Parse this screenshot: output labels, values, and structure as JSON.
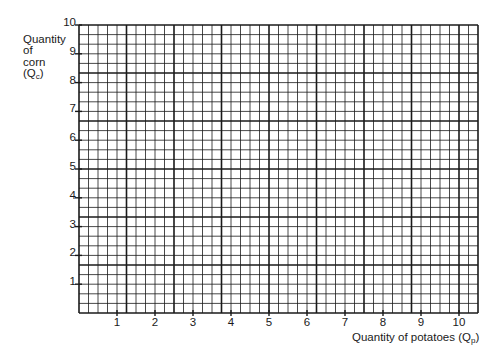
{
  "chart_data": {
    "type": "line",
    "title": "",
    "xlabel": "Quantity of potatoes",
    "xlabel_sub": "p",
    "ylabel_lines": [
      "Quantity",
      "of",
      "corn"
    ],
    "ylabel_symbol": "Q",
    "ylabel_sub": "c",
    "xlim": [
      0,
      10.5
    ],
    "ylim": [
      0,
      10
    ],
    "x_ticks": [
      1,
      2,
      3,
      4,
      5,
      6,
      7,
      8,
      9,
      10
    ],
    "y_ticks": [
      1,
      2,
      3,
      4,
      5,
      6,
      7,
      8,
      9,
      10
    ],
    "x_tick_labels": [
      "1",
      "2",
      "3",
      "4",
      "5",
      "6",
      "7",
      "8",
      "9",
      "10"
    ],
    "y_tick_labels": [
      "1",
      "2",
      "3",
      "4",
      "5",
      "6",
      "7",
      "8",
      "9",
      "10"
    ],
    "grid": true,
    "grid_minor_cells_per_unit_x": 4,
    "grid_minor_cells_per_unit_y": 3,
    "grid_major_every_n_cells": 5,
    "series": [],
    "line_color": "#1a1a1a"
  }
}
